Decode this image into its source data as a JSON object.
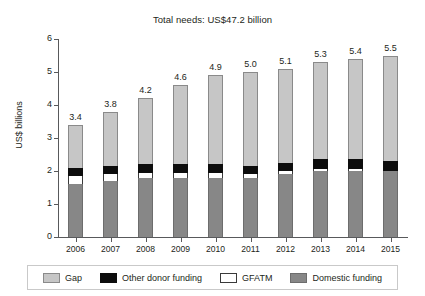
{
  "figure": {
    "title": "Total needs: US$47.2 billion",
    "ylabel": "US$ billions"
  },
  "legend": {
    "items": [
      {
        "label": "Gap",
        "color": "#c6c6c6",
        "swatch": "gap-swatch"
      },
      {
        "label": "Other donor funding",
        "color": "#0d0d0d",
        "swatch": "other-donor-swatch"
      },
      {
        "label": "GFATM",
        "color": "#ffffff",
        "swatch": "gfatm-swatch"
      },
      {
        "label": "Domestic funding",
        "color": "#878787",
        "swatch": "domestic-swatch"
      }
    ]
  },
  "chart_data": {
    "type": "bar",
    "stacked": true,
    "title": "Total needs: US$47.2 billion",
    "xlabel": "",
    "ylabel": "US$ billions",
    "ylim": [
      0,
      6
    ],
    "yticks": [
      0,
      1,
      2,
      3,
      4,
      5,
      6
    ],
    "ytick_labels": [
      "0",
      "1",
      "2",
      "3",
      "4",
      "5",
      "6"
    ],
    "grid": false,
    "legend_position": "bottom",
    "categories": [
      "2006",
      "2007",
      "2008",
      "2009",
      "2010",
      "2011",
      "2012",
      "2013",
      "2014",
      "2015"
    ],
    "totals": [
      3.4,
      3.8,
      4.2,
      4.6,
      4.9,
      5.0,
      5.1,
      5.3,
      5.4,
      5.5
    ],
    "total_labels": [
      "3.4",
      "3.8",
      "4.2",
      "4.6",
      "4.9",
      "5.0",
      "5.1",
      "5.3",
      "5.4",
      "5.5"
    ],
    "series": [
      {
        "name": "Domestic funding",
        "color": "#878787",
        "values": [
          1.6,
          1.7,
          1.8,
          1.8,
          1.8,
          1.8,
          1.9,
          2.0,
          2.0,
          2.0
        ]
      },
      {
        "name": "GFATM",
        "color": "#ffffff",
        "values": [
          0.25,
          0.2,
          0.15,
          0.15,
          0.15,
          0.1,
          0.1,
          0.05,
          0.05,
          0.0
        ]
      },
      {
        "name": "Other donor funding",
        "color": "#0d0d0d",
        "values": [
          0.25,
          0.25,
          0.25,
          0.25,
          0.25,
          0.25,
          0.25,
          0.3,
          0.3,
          0.3
        ]
      },
      {
        "name": "Gap",
        "color": "#c6c6c6",
        "values": [
          1.3,
          1.65,
          2.0,
          2.4,
          2.7,
          2.85,
          2.85,
          2.95,
          3.05,
          3.2
        ]
      }
    ]
  }
}
